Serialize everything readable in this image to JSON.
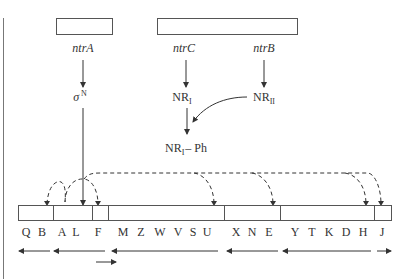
{
  "diagram": {
    "type": "gene-regulation",
    "top_genes": {
      "ntrA": "ntrA",
      "ntrC": "ntrC",
      "ntrB": "ntrB"
    },
    "proteins": {
      "sigma_symbol": "σ",
      "sigma_sup": "N",
      "nr1_base": "NR",
      "nr1_sub": "I",
      "nr2_base": "NR",
      "nr2_sub": "II",
      "nr1ph_base": "NR",
      "nr1ph_sub": "I",
      "nr1ph_suffix": "– Ph"
    },
    "operon_genes": [
      "Q",
      "B",
      "A",
      "L",
      "F",
      "M",
      "Z",
      "W",
      "V",
      "S",
      "U",
      "X",
      "N",
      "E",
      "Y",
      "T",
      "K",
      "D",
      "H",
      "J"
    ],
    "colors": {
      "line": "#333333",
      "box_border": "#555555",
      "background": "#ffffff"
    }
  }
}
